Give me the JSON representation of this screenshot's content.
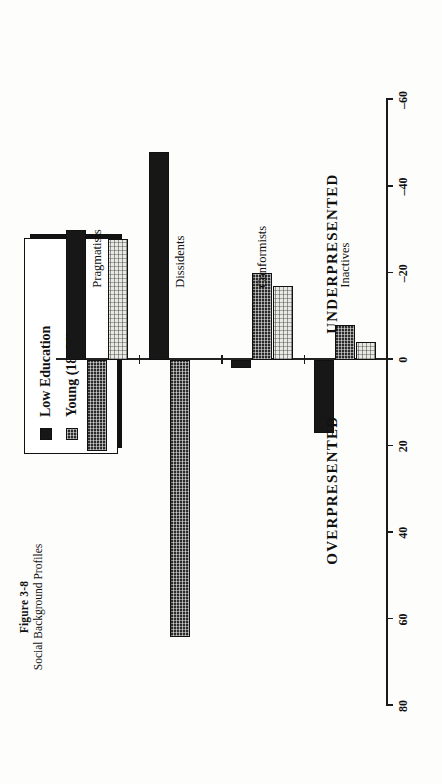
{
  "figure": {
    "number": "Figure 3-8",
    "subtitle": "Social Background Profiles"
  },
  "annotations": {
    "positive_side": "OVERPRESENTED",
    "negative_side": "UNDERPRESENTED"
  },
  "legend": {
    "items": [
      {
        "label": "Low Education",
        "swatch": "solid-black-swatch"
      },
      {
        "label": "Young (18–29)",
        "swatch": "dark-dotted-swatch"
      },
      {
        "label": "Women",
        "swatch": "light-stipple-swatch"
      }
    ]
  },
  "chart_data": {
    "type": "bar",
    "title": "Social Background Profiles",
    "xlabel": "",
    "ylabel": "",
    "orientation": "horizontal",
    "grid": false,
    "legend_position": "top-right",
    "ylim": [
      -60,
      80
    ],
    "tick_values": [
      80,
      60,
      40,
      20,
      0,
      -20,
      -40,
      -60
    ],
    "tick_labels": [
      "80",
      "60",
      "40",
      "20",
      "0",
      "–20",
      "–40",
      "–60"
    ],
    "categories": [
      "Inactives",
      "Conformists",
      "Dissidents",
      "Pragmatists"
    ],
    "series": [
      {
        "name": "Low Education",
        "values": [
          17,
          2,
          -48,
          -30
        ]
      },
      {
        "name": "Young (18–29)",
        "values": [
          -8,
          -20,
          64,
          21
        ]
      },
      {
        "name": "Women",
        "values": [
          -4,
          -17,
          0,
          -28
        ]
      }
    ]
  }
}
